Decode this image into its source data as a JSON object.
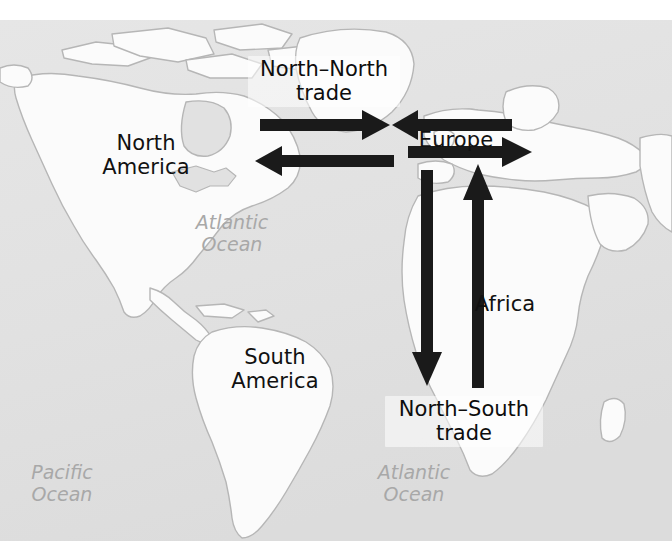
{
  "figure": {
    "type": "map-diagram",
    "background_color": "#ffffff",
    "ocean_color": "#e3e3e3",
    "land_color": "#fafafa",
    "coastline_color": "#b4b4b4",
    "arrow_color": "#1a1a1a",
    "label_color": "#111111",
    "ocean_label_color": "#a8a8a8"
  },
  "region_labels": [
    {
      "name": "north-america",
      "text": "North\nAmerica",
      "x": 98,
      "y": 132
    },
    {
      "name": "south-america",
      "text": "South\nAmerica",
      "x": 222,
      "y": 346
    },
    {
      "name": "europe",
      "text": "Europe",
      "x": 415,
      "y": 129
    },
    {
      "name": "africa",
      "text": "Africa",
      "x": 470,
      "y": 293
    }
  ],
  "ocean_labels": [
    {
      "name": "atlantic-ocean-north",
      "text": "Atlantic\nOcean",
      "x": 188,
      "y": 212
    },
    {
      "name": "atlantic-ocean-south",
      "text": "Atlantic\nOcean",
      "x": 370,
      "y": 462
    },
    {
      "name": "pacific-ocean",
      "text": "Pacific\nOcean",
      "x": 18,
      "y": 462
    }
  ],
  "trade_labels": [
    {
      "name": "north-north-trade-label",
      "text": "North–North\ntrade",
      "x": 248,
      "y": 56
    },
    {
      "name": "north-south-trade-label",
      "text": "North–South\ntrade",
      "x": 385,
      "y": 396
    }
  ],
  "arrows": [
    {
      "name": "arrow-north-america-to-europe",
      "direction": "right",
      "orientation": "horizontal",
      "from": "North America",
      "to": "Europe",
      "flow": "North–North trade",
      "x1": 260,
      "y1": 125,
      "x2": 388,
      "y2": 125
    },
    {
      "name": "arrow-europe-to-north-america-upper",
      "direction": "left",
      "orientation": "horizontal",
      "from": "Europe",
      "to": "North America",
      "flow": "North–North trade",
      "x1": 512,
      "y1": 125,
      "x2": 392,
      "y2": 125
    },
    {
      "name": "arrow-europe-to-north-america-lower",
      "direction": "left",
      "orientation": "horizontal",
      "from": "Europe",
      "to": "North America",
      "flow": "North–North trade",
      "x1": 394,
      "y1": 161,
      "x2": 255,
      "y2": 161
    },
    {
      "name": "arrow-europe-outgoing-east",
      "direction": "right",
      "orientation": "horizontal",
      "from": "Europe",
      "to": "east",
      "flow": "North–North trade",
      "x1": 408,
      "y1": 152,
      "x2": 532,
      "y2": 152
    },
    {
      "name": "arrow-europe-to-africa",
      "direction": "down",
      "orientation": "vertical",
      "from": "Europe",
      "to": "Africa",
      "flow": "North–South trade",
      "x1": 427,
      "y1": 170,
      "x2": 427,
      "y2": 385
    },
    {
      "name": "arrow-africa-to-europe",
      "direction": "up",
      "orientation": "vertical",
      "from": "Africa",
      "to": "Europe",
      "flow": "North–South trade",
      "x1": 478,
      "y1": 388,
      "x2": 478,
      "y2": 163
    }
  ],
  "legend_flows": [
    {
      "name": "north-north-trade",
      "label": "North–North trade",
      "between": "North America ↔ Europe"
    },
    {
      "name": "north-south-trade",
      "label": "North–South trade",
      "between": "Europe ↔ Africa"
    }
  ]
}
